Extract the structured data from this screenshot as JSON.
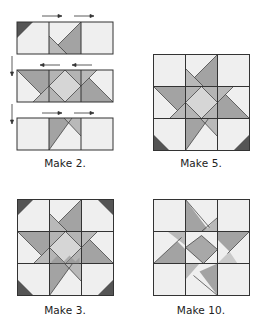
{
  "figure": {
    "panels": [
      {
        "id": "row-assembly",
        "label": "Make 2.",
        "description": "Three rows of units sewn together with pressing arrows"
      },
      {
        "id": "star-block-corners-bottom",
        "label": "Make 5.",
        "description": "Star block with dark corner triangles at bottom corners"
      },
      {
        "id": "star-block-four-corners",
        "label": "Make 3.",
        "description": "Star block with dark corner triangles at all four corners"
      },
      {
        "id": "star-block-no-corners",
        "label": "Make 10.",
        "description": "Star block without corner triangles"
      }
    ],
    "arrows": {
      "top_row": [
        "right",
        "right"
      ],
      "middle_row": [
        "left",
        "left"
      ],
      "bottom_row": [
        "right",
        "right"
      ],
      "row_join": [
        "down",
        "down"
      ]
    },
    "colors": {
      "background": "#efefef",
      "star_point": "#a3a3a3",
      "star_point_light": "#b9b9b9",
      "center_diamond": "#d6d6d6",
      "speckled": "#b4b4b4",
      "corner_dark": "#555555",
      "seam": "#333333"
    }
  }
}
